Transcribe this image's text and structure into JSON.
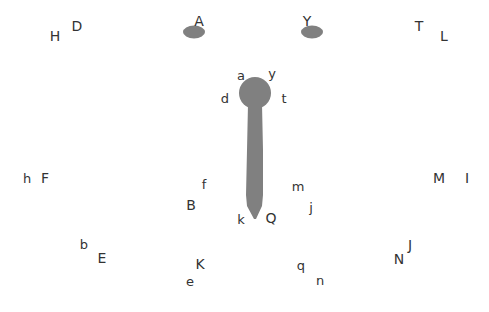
{
  "diagram": {
    "colors": {
      "shape_fill": "#808080",
      "text": "#333333",
      "background": "#ffffff"
    },
    "shapes": {
      "left_ellipse": {
        "cx": 194,
        "cy": 32,
        "rx": 11,
        "ry": 6.5
      },
      "right_ellipse": {
        "cx": 312,
        "cy": 32,
        "rx": 11,
        "ry": 6.5
      },
      "head_circle": {
        "cx": 255,
        "cy": 93,
        "r": 16
      },
      "stick": {
        "top_y": 104,
        "tip_y": 219,
        "top_half_width": 7,
        "mid_half_width": 8
      }
    },
    "labels": [
      {
        "id": "H",
        "text": "H",
        "x": 55,
        "y": 36
      },
      {
        "id": "D",
        "text": "D",
        "x": 77,
        "y": 26
      },
      {
        "id": "A",
        "text": "A",
        "x": 199,
        "y": 21
      },
      {
        "id": "Y",
        "text": "Y",
        "x": 307,
        "y": 21
      },
      {
        "id": "T",
        "text": "T",
        "x": 419,
        "y": 26
      },
      {
        "id": "L",
        "text": "L",
        "x": 444,
        "y": 36
      },
      {
        "id": "a",
        "text": "a",
        "x": 241,
        "y": 75
      },
      {
        "id": "y",
        "text": "y",
        "x": 272,
        "y": 73
      },
      {
        "id": "d",
        "text": "d",
        "x": 225,
        "y": 98
      },
      {
        "id": "t",
        "text": "t",
        "x": 284,
        "y": 98
      },
      {
        "id": "h",
        "text": "h",
        "x": 27,
        "y": 178
      },
      {
        "id": "F",
        "text": "F",
        "x": 45,
        "y": 178
      },
      {
        "id": "f",
        "text": "f",
        "x": 204,
        "y": 184
      },
      {
        "id": "B",
        "text": "B",
        "x": 191,
        "y": 205
      },
      {
        "id": "m",
        "text": "m",
        "x": 298,
        "y": 186
      },
      {
        "id": "j",
        "text": "j",
        "x": 311,
        "y": 207
      },
      {
        "id": "M",
        "text": "M",
        "x": 439,
        "y": 178
      },
      {
        "id": "I",
        "text": "I",
        "x": 467,
        "y": 178
      },
      {
        "id": "k",
        "text": "k",
        "x": 241,
        "y": 219
      },
      {
        "id": "Q",
        "text": "Q",
        "x": 271,
        "y": 218
      },
      {
        "id": "b",
        "text": "b",
        "x": 84,
        "y": 244
      },
      {
        "id": "E",
        "text": "E",
        "x": 102,
        "y": 258
      },
      {
        "id": "K",
        "text": "K",
        "x": 200,
        "y": 264
      },
      {
        "id": "e",
        "text": "e",
        "x": 190,
        "y": 281
      },
      {
        "id": "q",
        "text": "q",
        "x": 301,
        "y": 265
      },
      {
        "id": "n",
        "text": "n",
        "x": 320,
        "y": 280
      },
      {
        "id": "N",
        "text": "N",
        "x": 399,
        "y": 259
      },
      {
        "id": "J",
        "text": "J",
        "x": 410,
        "y": 245
      }
    ]
  }
}
